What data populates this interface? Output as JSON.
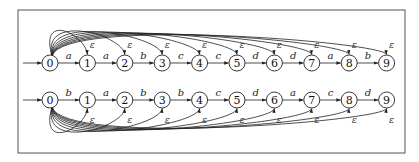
{
  "diagram": {
    "type": "automaton",
    "frame": {
      "x": 18,
      "y": 10,
      "width": 387,
      "height": 143
    },
    "layout": {
      "x0": 50,
      "dx": 37.4,
      "node_radius": 8
    },
    "automata": [
      {
        "id": "top",
        "row_y": 63,
        "start_state": "0",
        "states": [
          "0",
          "1",
          "2",
          "3",
          "4",
          "5",
          "6",
          "7",
          "8",
          "9"
        ],
        "transitions": [
          {
            "from": "0",
            "to": "1",
            "label": "a"
          },
          {
            "from": "1",
            "to": "2",
            "label": "a"
          },
          {
            "from": "2",
            "to": "3",
            "label": "b"
          },
          {
            "from": "3",
            "to": "4",
            "label": "c"
          },
          {
            "from": "4",
            "to": "5",
            "label": "c"
          },
          {
            "from": "5",
            "to": "6",
            "label": "d"
          },
          {
            "from": "6",
            "to": "7",
            "label": "d"
          },
          {
            "from": "7",
            "to": "8",
            "label": "a"
          },
          {
            "from": "8",
            "to": "9",
            "label": "b"
          }
        ],
        "epsilon_edges": {
          "from": "0",
          "to": [
            "1",
            "2",
            "3",
            "4",
            "5",
            "6",
            "7",
            "8",
            "9"
          ],
          "label": "ε",
          "side": "above"
        }
      },
      {
        "id": "bottom",
        "row_y": 100,
        "start_state": "0",
        "states": [
          "0",
          "1",
          "2",
          "3",
          "4",
          "5",
          "6",
          "7",
          "8",
          "9"
        ],
        "transitions": [
          {
            "from": "0",
            "to": "1",
            "label": "b"
          },
          {
            "from": "1",
            "to": "2",
            "label": "a"
          },
          {
            "from": "2",
            "to": "3",
            "label": "b"
          },
          {
            "from": "3",
            "to": "4",
            "label": "b"
          },
          {
            "from": "4",
            "to": "5",
            "label": "c"
          },
          {
            "from": "5",
            "to": "6",
            "label": "d"
          },
          {
            "from": "6",
            "to": "7",
            "label": "a"
          },
          {
            "from": "7",
            "to": "8",
            "label": "c"
          },
          {
            "from": "8",
            "to": "9",
            "label": "d"
          }
        ],
        "epsilon_edges": {
          "from": "0",
          "to": [
            "1",
            "2",
            "3",
            "4",
            "5",
            "6",
            "7",
            "8",
            "9"
          ],
          "label": "ε",
          "side": "below"
        }
      }
    ],
    "colors": {
      "stroke": "#222222",
      "frame": "#555555",
      "background": "#ffffff"
    }
  }
}
